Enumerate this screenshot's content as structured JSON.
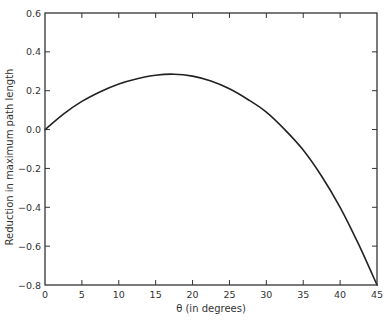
{
  "chart_data": {
    "type": "line",
    "title": "",
    "xlabel": "θ (in degrees)",
    "ylabel": "Reduction in maximum path length",
    "xlim": [
      0,
      45
    ],
    "ylim": [
      -0.8,
      0.6
    ],
    "x_ticks": [
      0,
      5,
      10,
      15,
      20,
      25,
      30,
      35,
      40,
      45
    ],
    "x_tick_labels": [
      "0",
      "5",
      "10",
      "15",
      "20",
      "25",
      "30",
      "35",
      "40",
      "45"
    ],
    "y_ticks": [
      -0.8,
      -0.6,
      -0.4,
      -0.2,
      0.0,
      0.2,
      0.4,
      0.6
    ],
    "y_tick_labels": [
      "−0.8",
      "−0.6",
      "−0.4",
      "−0.2",
      "0.0",
      "0.2",
      "0.4",
      "0.6"
    ],
    "grid": false,
    "legend": null,
    "series": [
      {
        "name": "reduction",
        "color": "#222222",
        "x": [
          0,
          2.5,
          5,
          7.5,
          10,
          12.5,
          15,
          17.5,
          20,
          22.5,
          25,
          27.5,
          30,
          32.5,
          35,
          37.5,
          40,
          42.5,
          45
        ],
        "values": [
          0.0,
          0.08,
          0.145,
          0.195,
          0.235,
          0.262,
          0.28,
          0.285,
          0.275,
          0.25,
          0.21,
          0.155,
          0.09,
          0.0,
          -0.105,
          -0.24,
          -0.4,
          -0.59,
          -0.8
        ]
      }
    ]
  },
  "colors": {
    "axis": "#333333",
    "line": "#222222",
    "text": "#333333",
    "background": "#ffffff"
  }
}
